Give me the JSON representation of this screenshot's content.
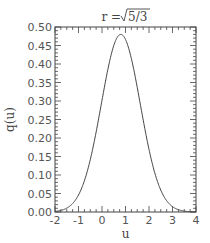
{
  "chart_data": {
    "type": "line",
    "title_parts": {
      "lhs": "r = ",
      "radicand": "5/3"
    },
    "xlabel": "u",
    "ylabel": "q(u)",
    "xlim": [
      -2,
      4
    ],
    "ylim": [
      0,
      0.5
    ],
    "x_ticks": [
      -2,
      -1,
      0,
      1,
      2,
      3,
      4
    ],
    "x_tick_labels": [
      "-2",
      "-1",
      "0",
      "1",
      "2",
      "3",
      "4"
    ],
    "y_ticks": [
      0,
      0.05,
      0.1,
      0.15,
      0.2,
      0.25,
      0.3,
      0.35,
      0.4,
      0.45,
      0.5
    ],
    "y_tick_labels": [
      "0.00",
      "0.05",
      "0.10",
      "0.15",
      "0.20",
      "0.25",
      "0.30",
      "0.35",
      "0.40",
      "0.45",
      "0.50"
    ],
    "grid": false,
    "series": [
      {
        "name": "q(u)",
        "color": "#444444",
        "x": [
          -2.0,
          -1.5,
          -1.0,
          -0.5,
          0.0,
          0.25,
          0.5,
          0.75,
          0.85,
          1.0,
          1.25,
          1.5,
          2.0,
          2.5,
          3.0,
          3.5,
          4.0
        ],
        "y": [
          0.0,
          0.004,
          0.03,
          0.1,
          0.25,
          0.34,
          0.43,
          0.48,
          0.48,
          0.46,
          0.39,
          0.31,
          0.15,
          0.06,
          0.02,
          0.005,
          0.0
        ]
      }
    ],
    "peak": {
      "u": 0.8,
      "q": 0.48
    }
  }
}
